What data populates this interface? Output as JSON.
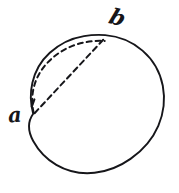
{
  "figure": {
    "kind": "geometry-diagram",
    "background_color": "#ffffff",
    "ink_color": "#16161a",
    "stroke_width_solid": 1.9,
    "stroke_width_dashed": 2.0,
    "dash_pattern": "5 4",
    "circle": {
      "center_x": 97,
      "center_y": 107,
      "radius": 68,
      "style": "solid"
    },
    "points": [
      {
        "id": "a",
        "label": "a",
        "x": 33,
        "y": 114,
        "label_x": 16,
        "label_y": 118
      },
      {
        "id": "b",
        "label": "b",
        "x": 105,
        "y": 35,
        "label_x": 118,
        "label_y": 19
      }
    ],
    "arcs": [
      {
        "id": "dashed-arc-a-b",
        "from": "a",
        "to": "b",
        "style": "dashed",
        "bulge": "outward-upper-left"
      }
    ],
    "chords": [
      {
        "id": "dashed-chord-a-b",
        "from": "a",
        "to": "b",
        "style": "dashed"
      }
    ]
  }
}
